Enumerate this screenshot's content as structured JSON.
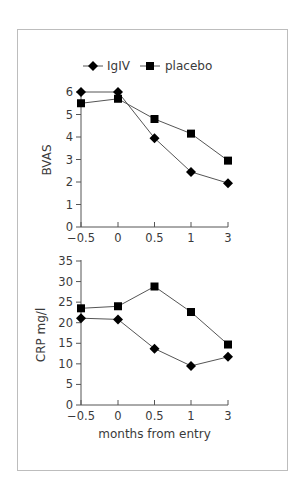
{
  "legend": {
    "items": [
      {
        "label": "IgIV",
        "marker": "diamond"
      },
      {
        "label": "placebo",
        "marker": "square"
      }
    ]
  },
  "colors": {
    "frame": "#bdbdbd",
    "axis": "#555555",
    "line": "#555555",
    "marker": "#000000",
    "text": "#3a3a3a"
  },
  "chart_data": [
    {
      "type": "line",
      "title": "",
      "xlabel": "",
      "ylabel": "BVAS",
      "categories": [
        "-0.5",
        "0",
        "0.5",
        "1",
        "3"
      ],
      "ylim": [
        0,
        6
      ],
      "yticks": [
        0,
        1,
        2,
        3,
        4,
        5,
        6
      ],
      "grid": false,
      "legend_position": "top",
      "series": [
        {
          "name": "IgIV",
          "marker": "diamond",
          "values": [
            6.0,
            6.0,
            3.95,
            2.45,
            1.95
          ]
        },
        {
          "name": "placebo",
          "marker": "square",
          "values": [
            5.5,
            5.7,
            4.8,
            4.15,
            2.95
          ]
        }
      ]
    },
    {
      "type": "line",
      "title": "",
      "xlabel": "months from entry",
      "ylabel": "CRP mg/l",
      "categories": [
        "-0.5",
        "0",
        "0.5",
        "1",
        "3"
      ],
      "ylim": [
        0,
        35
      ],
      "yticks": [
        0,
        5,
        10,
        15,
        20,
        25,
        30,
        35
      ],
      "grid": false,
      "series": [
        {
          "name": "IgIV",
          "marker": "diamond",
          "values": [
            21.1,
            20.8,
            13.7,
            9.5,
            11.7
          ]
        },
        {
          "name": "placebo",
          "marker": "square",
          "values": [
            23.5,
            24.0,
            28.8,
            22.6,
            14.7
          ]
        }
      ]
    }
  ]
}
